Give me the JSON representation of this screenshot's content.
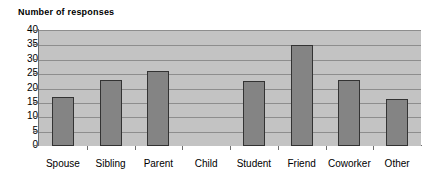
{
  "chart_data": {
    "type": "bar",
    "title": "Number of responses",
    "xlabel": "",
    "ylabel": "",
    "categories": [
      "Spouse",
      "Sibling",
      "Parent",
      "Child",
      "Student",
      "Friend",
      "Coworker",
      "Other"
    ],
    "values": [
      17,
      23,
      26,
      0,
      22.5,
      35,
      23,
      16.5
    ],
    "series": [
      {
        "name": "Number of responses",
        "values": [
          17,
          23,
          26,
          0,
          22.5,
          35,
          23,
          16.5
        ]
      }
    ],
    "ylim": [
      0,
      40
    ],
    "ytick_labels": [
      "40",
      "35",
      "30",
      "25",
      "20",
      "15",
      "10",
      "5",
      "0"
    ],
    "ytick_values": [
      40,
      35,
      30,
      25,
      20,
      15,
      10,
      5,
      0
    ],
    "ytick_step": 5,
    "grid": true,
    "grid_axis": "y",
    "legend": false,
    "legend_position": "none",
    "colors": {
      "bar_fill": "#848484",
      "bar_border": "#333333",
      "plot_background": "#c3c3c3",
      "gridline": "#8d8d8d",
      "axis_line": "#6e6e6e",
      "text": "#000000",
      "page_background": "#ffffff"
    }
  }
}
